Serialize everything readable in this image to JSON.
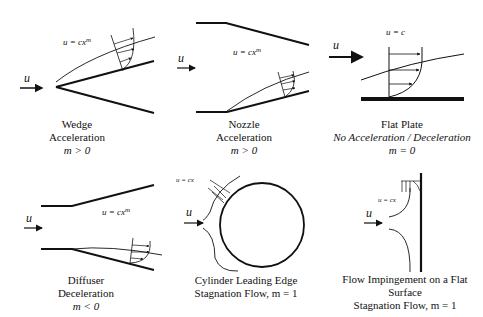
{
  "panels": [
    {
      "id": "wedge",
      "title": "Wedge",
      "subtitle": "Acceleration",
      "condition": "m > 0",
      "equation": "u = cx",
      "equation_exp": "m",
      "inflow": "u"
    },
    {
      "id": "nozzle",
      "title": "Nozzle",
      "subtitle": "Acceleration",
      "condition": "m > 0",
      "equation": "u = cx",
      "equation_exp": "m",
      "inflow": "u"
    },
    {
      "id": "flat-plate",
      "title": "Flat Plate",
      "subtitle": "No Acceleration / Deceleration",
      "condition": "m = 0",
      "equation": "u = c",
      "equation_exp": "",
      "inflow": "u"
    },
    {
      "id": "diffuser",
      "title": "Diffuser",
      "subtitle": "Deceleration",
      "condition": "m < 0",
      "equation": "u = cx",
      "equation_exp": "m",
      "inflow": "u"
    },
    {
      "id": "cylinder",
      "title": "Cylinder Leading Edge",
      "subtitle": "Stagnation Flow, m = 1",
      "condition": "",
      "equation": "u = cx",
      "equation_exp": "",
      "inflow": "u"
    },
    {
      "id": "impingement",
      "title": "Flow Impingement on a Flat",
      "subtitle": "Surface",
      "condition": "Stagnation Flow, m = 1",
      "equation": "u = cx",
      "equation_exp": "",
      "inflow": "u"
    }
  ],
  "colors": {
    "line": "#111111",
    "background": "#ffffff"
  }
}
